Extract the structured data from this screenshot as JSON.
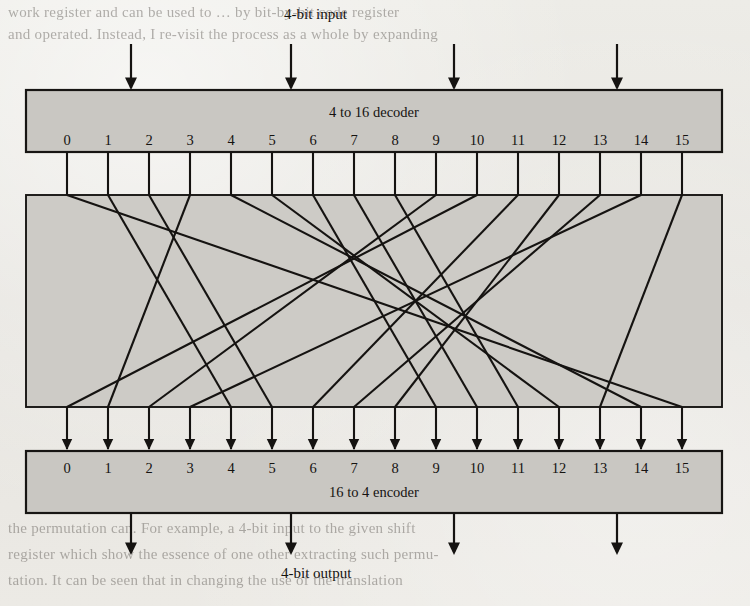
{
  "page": {
    "background_color": "#e9e7e2",
    "ink_color": "#151311",
    "box_fill_color": "#c9c7c2"
  },
  "figure": {
    "input_label": "4-bit input",
    "output_label": "4-bit output",
    "decoder": {
      "name": "decoder-box",
      "title": "4 to 16 decoder",
      "terminals": [
        "0",
        "1",
        "2",
        "3",
        "4",
        "5",
        "6",
        "7",
        "8",
        "9",
        "10",
        "11",
        "12",
        "13",
        "14",
        "15"
      ]
    },
    "permutation_box": {
      "name": "permutation-box",
      "title": ""
    },
    "encoder": {
      "name": "encoder-box",
      "title": "16 to 4 encoder",
      "terminals": [
        "0",
        "1",
        "2",
        "3",
        "4",
        "5",
        "6",
        "7",
        "8",
        "9",
        "10",
        "11",
        "12",
        "13",
        "14",
        "15"
      ]
    },
    "input_arrows": 4,
    "output_arrows": 4
  },
  "chart_data": {
    "type": "diagram",
    "decoder_terminals": [
      0,
      1,
      2,
      3,
      4,
      5,
      6,
      7,
      8,
      9,
      10,
      11,
      12,
      13,
      14,
      15
    ],
    "encoder_terminals": [
      0,
      1,
      2,
      3,
      4,
      5,
      6,
      7,
      8,
      9,
      10,
      11,
      12,
      13,
      14,
      15
    ],
    "permutation_mapping": [
      {
        "from": 0,
        "to": 15
      },
      {
        "from": 1,
        "to": 4
      },
      {
        "from": 2,
        "to": 5
      },
      {
        "from": 3,
        "to": 1
      },
      {
        "from": 4,
        "to": 14
      },
      {
        "from": 5,
        "to": 12
      },
      {
        "from": 6,
        "to": 9
      },
      {
        "from": 7,
        "to": 10
      },
      {
        "from": 8,
        "to": 11
      },
      {
        "from": 9,
        "to": 2
      },
      {
        "from": 10,
        "to": 0
      },
      {
        "from": 11,
        "to": 6
      },
      {
        "from": 12,
        "to": 8
      },
      {
        "from": 13,
        "to": 7
      },
      {
        "from": 14,
        "to": 3
      },
      {
        "from": 15,
        "to": 13
      }
    ],
    "xlabel": "decoder output line",
    "ylabel": "encoder input line",
    "grid": false,
    "legend": "none"
  },
  "background_text": {
    "top_lines": [
      "work register and can be used to … by bit-by-bit code register",
      "and operated.  Instead, I re-visit the process as a whole by expanding"
    ],
    "middle_lines": [
      "The transformation is usually",
      "binary.  A permutation of",
      "with encryption and",
      "invertible substitution of",
      "the result, the number",
      "growth"
    ],
    "bottom_lines": [
      "the permutation can.  For example, a 4-bit input to the given  shift",
      "register which show the essence of one other extracting such permu-",
      "tation.  It can be seen that in changing  the use of the translation"
    ]
  }
}
